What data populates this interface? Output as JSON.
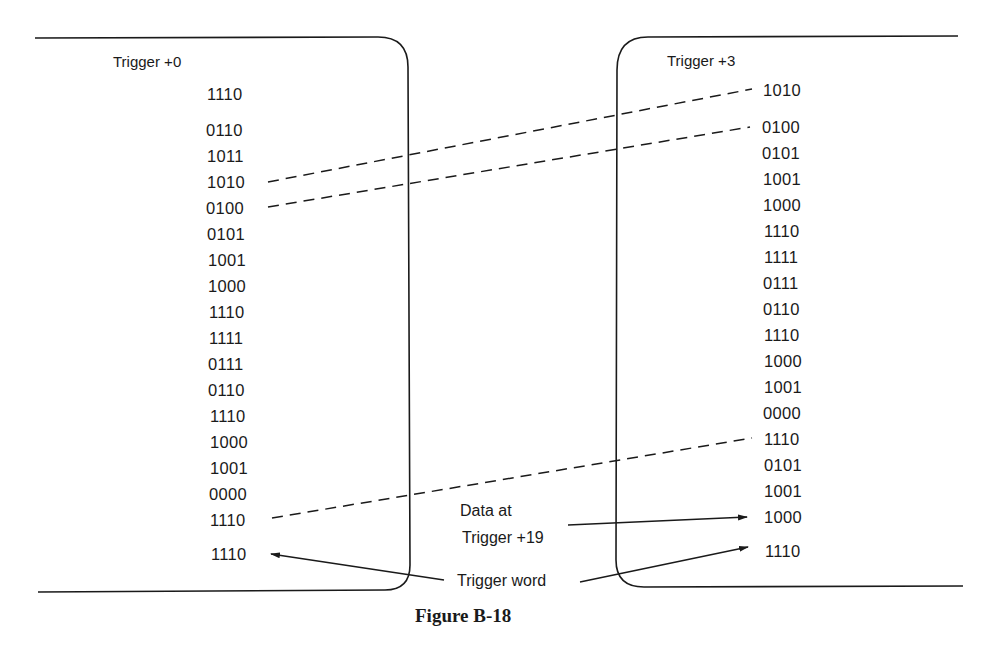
{
  "figure": {
    "caption": "Figure B-18",
    "left_panel": {
      "header": "Trigger +0",
      "words": [
        "1110",
        "0110",
        "1011",
        "1010",
        "0100",
        "0101",
        "1001",
        "1000",
        "1110",
        "1111",
        "0111",
        "0110",
        "1110",
        "1000",
        "1001",
        "0000",
        "1110",
        "1110"
      ]
    },
    "right_panel": {
      "header": "Trigger +3",
      "words": [
        "1010",
        "0100",
        "0101",
        "1001",
        "1000",
        "1110",
        "1111",
        "0111",
        "0110",
        "1110",
        "1000",
        "1001",
        "0000",
        "1110",
        "0101",
        "1001",
        "1000",
        "1110"
      ]
    },
    "annotations": {
      "data_at_line1": "Data at",
      "data_at_line2": "Trigger +19",
      "trigger_word": "Trigger word"
    },
    "connections": [
      {
        "from": "left 1010",
        "to": "right 1010",
        "style": "dashed"
      },
      {
        "from": "left 0100",
        "to": "right 0100",
        "style": "dashed"
      },
      {
        "from": "left 1110 (row 17)",
        "to": "right 1110 (row 14)",
        "style": "dashed"
      },
      {
        "from": "Data at Trigger +19",
        "to": "right 1000 (row 17)",
        "style": "arrow"
      },
      {
        "from": "Trigger word",
        "to": "left 1110 (last)",
        "style": "arrow"
      },
      {
        "from": "Trigger word",
        "to": "right 1110 (last)",
        "style": "arrow"
      }
    ]
  }
}
